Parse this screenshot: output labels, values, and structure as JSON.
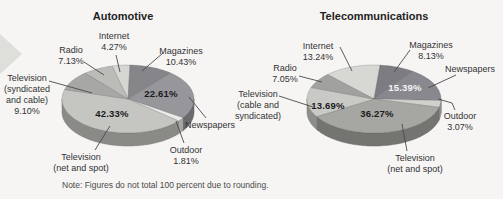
{
  "note": "Note: Figures do not total 100 percent due to rounding.",
  "chart_data": [
    {
      "type": "pie",
      "title": "Automotive",
      "labels": [
        "Internet",
        "Magazines",
        "Newspapers",
        "Outdoor",
        "Television (net and spot)",
        "Television (syndicated and cable)",
        "Radio"
      ],
      "values": [
        4.27,
        10.43,
        22.61,
        1.81,
        42.33,
        9.1,
        7.13
      ],
      "pct_labels": [
        "4.27%",
        "10.43%",
        "22.61%",
        "1.81%",
        "42.33%",
        "9.10%",
        "7.13%"
      ],
      "slice_colors": [
        "#d5d5d1",
        "#85858a",
        "#97979b",
        "#edebe7",
        "#c5c5c1",
        "#a7a7a5",
        "#bbbbb7"
      ],
      "callout_lines": [
        [
          "Internet",
          "4.27%"
        ],
        [
          "Magazines",
          "10.43%"
        ],
        [
          "Newspapers"
        ],
        [
          "Outdoor",
          "1.81%"
        ],
        [
          "Television",
          "(net and spot)"
        ],
        [
          "Television",
          "(syndicated",
          "and cable)",
          "9.10%"
        ],
        [
          "Radio",
          "7.13%"
        ]
      ],
      "inner_labels": [
        null,
        null,
        "22.61%",
        null,
        "42.33%",
        null,
        null
      ],
      "inner_label_colors": [
        null,
        null,
        "#1b1b1b",
        null,
        "#1b1b1b",
        null,
        null
      ]
    },
    {
      "type": "pie",
      "title": "Telecommunications",
      "labels": [
        "Internet",
        "Magazines",
        "Newspapers",
        "Outdoor",
        "Television (net and spot)",
        "Television (cable and syndicated)",
        "Radio"
      ],
      "values": [
        13.24,
        8.13,
        15.39,
        3.07,
        36.27,
        13.69,
        7.05
      ],
      "pct_labels": [
        "13.24%",
        "8.13%",
        "15.39%",
        "3.07%",
        "36.27%",
        "13.69%",
        "7.05%"
      ],
      "slice_colors": [
        "#d7d7d3",
        "#7c7c82",
        "#88888e",
        "#d0d0cc",
        "#a6a6a2",
        "#c9c9c5",
        "#a1a19f"
      ],
      "callout_lines": [
        [
          "Internet",
          "13.24%"
        ],
        [
          "Magazines",
          "8.13%"
        ],
        [
          "Newspapers"
        ],
        [
          "Outdoor",
          "3.07%"
        ],
        [
          "Television",
          "(net and spot)"
        ],
        [
          "Television",
          "(cable and",
          "syndicated)"
        ],
        [
          "Radio",
          "7.05%"
        ]
      ],
      "inner_labels": [
        null,
        null,
        "15.39%",
        null,
        "36.27%",
        "13.69%",
        null
      ],
      "inner_label_colors": [
        null,
        null,
        "#f4f4f2",
        null,
        "#1b1b1b",
        "#1b1b1b",
        null
      ]
    }
  ]
}
